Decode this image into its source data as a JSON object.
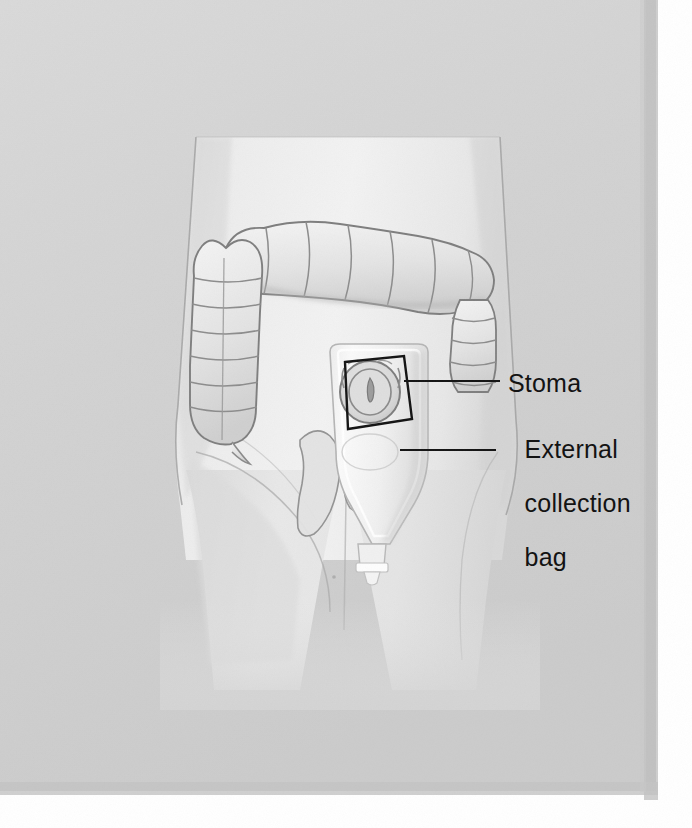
{
  "illustration": {
    "title": "Colostomy with external collection bag",
    "subject": "colon-and-ostomy-appliance",
    "background_color": "#d4d4d4",
    "panel_color": "#d2d2d2",
    "body_color": "#ededed",
    "ink_color": "#131313",
    "outline_color": "#8d8d8d"
  },
  "labels": {
    "stoma": "Stoma",
    "bag_line1": "External",
    "bag_line2": "collection",
    "bag_line3": "bag"
  },
  "anatomy": {
    "torso": "torso",
    "legs": "legs",
    "colon": "large-intestine",
    "transverse_colon": "transverse-colon",
    "ascending_colon": "ascending-colon",
    "descending_colon": "descending-colon",
    "cecum_tail": "cecum-tail",
    "hip_contour": "hip-contour"
  },
  "appliance": {
    "bag": "external-collection-bag",
    "stoma_opening": "stoma-opening",
    "drain_spout": "drain-spout",
    "clamp": "drain-clamp",
    "callout_box": "stoma-callout-box",
    "stoma_leader": "stoma-leader-line",
    "bag_leader": "bag-leader-line"
  }
}
